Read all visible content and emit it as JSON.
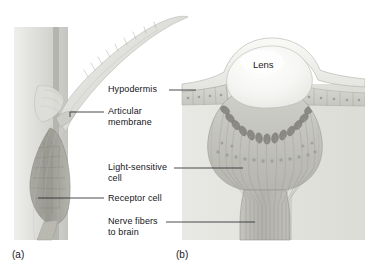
{
  "figure": {
    "type": "biological-diagram",
    "background_color": "#ffffff",
    "panels": [
      {
        "id": "a",
        "letter": "(a)",
        "caption": "sensory seta with articular membrane and receptor cell"
      },
      {
        "id": "b",
        "letter": "(b)",
        "caption": "ocellus simple eye with lens and retina"
      }
    ]
  },
  "labels": {
    "hypodermis": "Hypodermis",
    "articular_membrane_line1": "Articular",
    "articular_membrane_line2": "membrane",
    "light_sensitive_line1": "Light-sensitive",
    "light_sensitive_line2": "cell",
    "receptor_cell": "Receptor cell",
    "nerve_fibers_line1": "Nerve fibers",
    "nerve_fibers_line2": "to brain",
    "lens": "Lens",
    "panel_a": "(a)",
    "panel_b": "(b)"
  },
  "colors": {
    "ink": "#15151a",
    "leader_line": "#2a2a30",
    "cuticle_light": "#e3e3e0",
    "cuticle_mid": "#c9c9c5",
    "cuticle_dark": "#a8a8a4",
    "tissue_light": "#d6d6d2",
    "tissue_mid": "#bcbcb8",
    "tissue_dark": "#97978f",
    "pigment_cell": "#8e8e88",
    "lens_fill": "#f2f2f0",
    "outline": "#8a8a84",
    "background": "#ffffff"
  }
}
